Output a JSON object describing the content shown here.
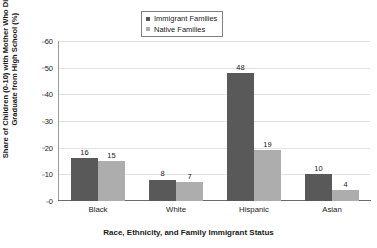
{
  "chart_data": {
    "type": "bar",
    "title": "",
    "subtitle": "",
    "categories": [
      "Black",
      "White",
      "Hispanic",
      "Asian"
    ],
    "series": [
      {
        "name": "Immigrant Families",
        "values": [
          16,
          8,
          48,
          10
        ],
        "color": "#595959"
      },
      {
        "name": "Native Families",
        "values": [
          15,
          7,
          19,
          4
        ],
        "color": "#adadad"
      }
    ],
    "xlabel": "Race, Ethnicity, and Family Immigrant Status",
    "ylabel": "Share of Children (0-10) with Mother Who Did Not Graduate from High School (%)",
    "ylabel_line1": "Share of Children (0-10) with Mother Who Did Not",
    "ylabel_line2": "Graduate from High School (%)",
    "ylim": [
      0,
      60
    ],
    "ytick_labels": [
      "0",
      "10",
      "20",
      "30",
      "40",
      "50",
      "60"
    ],
    "ytick_values": [
      0,
      10,
      20,
      30,
      40,
      50,
      60
    ],
    "grid": true,
    "grid_axis": "y",
    "legend_position": "top-center",
    "legend_border": true,
    "data_labels": true,
    "axis_color": "#808080",
    "grid_color": "#e2e2e2",
    "text_color": "#1a1a1a",
    "background": "#ffffff"
  }
}
